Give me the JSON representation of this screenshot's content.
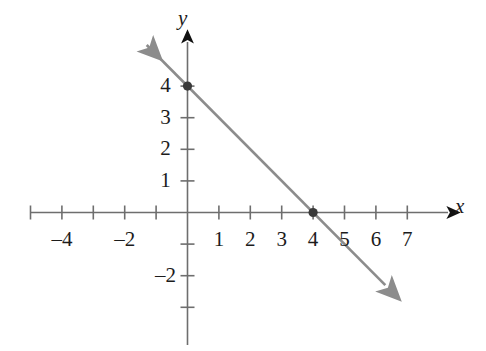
{
  "chart_data": {
    "type": "line",
    "title": "",
    "xlabel": "x",
    "ylabel": "y",
    "equation": "y = -x + 4",
    "slope": -1,
    "y_intercept": 4,
    "x_intercept": 4,
    "xlim": [
      -5,
      7.5
    ],
    "ylim": [
      -3.5,
      4.5
    ],
    "grid": false,
    "legend": null,
    "series": [
      {
        "name": "line",
        "color": "#8c8c8c",
        "arrow_start": true,
        "arrow_end": true,
        "x": [
          -1.3,
          6.3
        ],
        "y": [
          5.3,
          -2.3
        ]
      }
    ],
    "points": [
      {
        "label": "(0, 4)",
        "x": 0,
        "y": 4,
        "color": "#3a3a3a"
      },
      {
        "label": "(4, 0)",
        "x": 4,
        "y": 0,
        "color": "#3a3a3a"
      }
    ],
    "x_ticks": [
      -5,
      -4,
      -3,
      -2,
      -1,
      1,
      2,
      3,
      4,
      5,
      6,
      7
    ],
    "x_tick_labels": [
      {
        "value": -4,
        "text": "–4"
      },
      {
        "value": -2,
        "text": "–2"
      },
      {
        "value": 1,
        "text": "1"
      },
      {
        "value": 2,
        "text": "2"
      },
      {
        "value": 3,
        "text": "3"
      },
      {
        "value": 4,
        "text": "4"
      },
      {
        "value": 5,
        "text": "5"
      },
      {
        "value": 6,
        "text": "6"
      },
      {
        "value": 7,
        "text": "7"
      }
    ],
    "y_ticks": [
      -3,
      -2,
      -1,
      1,
      2,
      3,
      4
    ],
    "y_tick_labels": [
      {
        "value": 4,
        "text": "4"
      },
      {
        "value": 3,
        "text": "3"
      },
      {
        "value": 2,
        "text": "2"
      },
      {
        "value": 1,
        "text": "1"
      },
      {
        "value": -2,
        "text": "–2"
      }
    ],
    "axis_color": "#6e6e6e",
    "arrow_color": "#111111",
    "line_color": "#8c8c8c"
  },
  "axes": {
    "x_name": "x",
    "y_name": "y"
  }
}
